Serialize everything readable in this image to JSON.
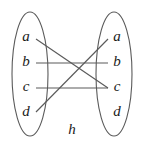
{
  "diagram": {
    "function_label": "h",
    "domain_set": {
      "name": "domain-ellipse",
      "elements": [
        {
          "label": "a",
          "x": 26,
          "y": 38
        },
        {
          "label": "b",
          "x": 26,
          "y": 63
        },
        {
          "label": "c",
          "x": 26,
          "y": 88
        },
        {
          "label": "d",
          "x": 26,
          "y": 113
        }
      ],
      "ellipse": {
        "cx": 30,
        "cy": 74,
        "rx": 18,
        "ry": 62
      }
    },
    "codomain_set": {
      "name": "codomain-ellipse",
      "elements": [
        {
          "label": "a",
          "x": 117,
          "y": 38
        },
        {
          "label": "b",
          "x": 117,
          "y": 63
        },
        {
          "label": "c",
          "x": 117,
          "y": 88
        },
        {
          "label": "d",
          "x": 117,
          "y": 113
        }
      ],
      "ellipse": {
        "cx": 114,
        "cy": 74,
        "rx": 18,
        "ry": 62
      }
    },
    "mappings": [
      {
        "from": "a",
        "to": "c",
        "x1": 36,
        "y1": 39,
        "x2": 108,
        "y2": 88
      },
      {
        "from": "b",
        "to": "b",
        "x1": 36,
        "y1": 63,
        "x2": 108,
        "y2": 63
      },
      {
        "from": "c",
        "to": "c",
        "x1": 36,
        "y1": 88,
        "x2": 108,
        "y2": 88
      },
      {
        "from": "d",
        "to": "a",
        "x1": 36,
        "y1": 112,
        "x2": 108,
        "y2": 39
      }
    ],
    "function_label_pos": {
      "x": 72,
      "y": 131
    }
  },
  "colors": {
    "stroke": "#5a5a5a",
    "text": "#1a1a1a",
    "background": "#ffffff"
  }
}
